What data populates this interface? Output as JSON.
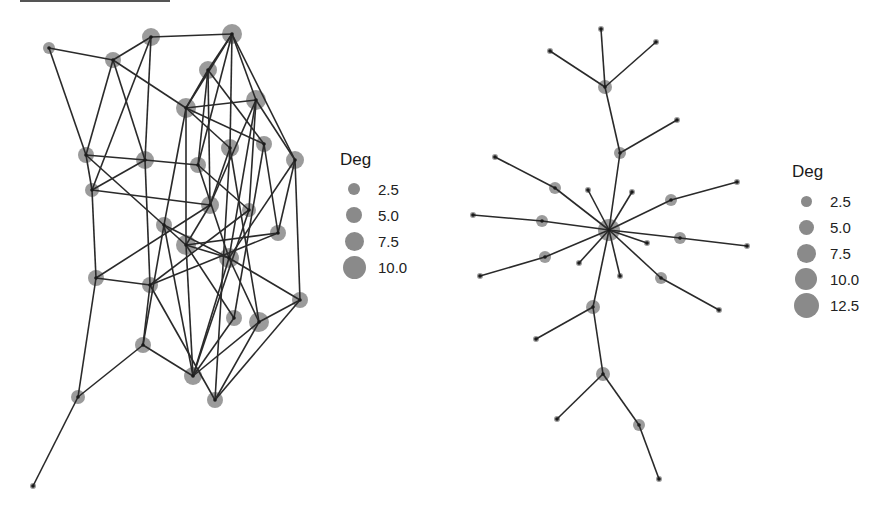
{
  "colors": {
    "edge": "#2a2a2a",
    "node": "#8a8a8a",
    "node_center": "#1a1a1a",
    "background": "#ffffff"
  },
  "graphs": [
    {
      "name": "left-network",
      "legend": {
        "title": "Deg",
        "left": 340,
        "top": 150,
        "items": [
          {
            "label": "2.5",
            "size": 12
          },
          {
            "label": "5.0",
            "size": 16
          },
          {
            "label": "7.5",
            "size": 19
          },
          {
            "label": "10.0",
            "size": 23
          }
        ]
      },
      "nodes": [
        {
          "x": 49,
          "y": 48,
          "r": 6
        },
        {
          "x": 113,
          "y": 60,
          "r": 8
        },
        {
          "x": 151,
          "y": 37,
          "r": 9
        },
        {
          "x": 232,
          "y": 34,
          "r": 10
        },
        {
          "x": 208,
          "y": 70,
          "r": 9
        },
        {
          "x": 186,
          "y": 108,
          "r": 10
        },
        {
          "x": 256,
          "y": 100,
          "r": 10
        },
        {
          "x": 86,
          "y": 155,
          "r": 8
        },
        {
          "x": 145,
          "y": 160,
          "r": 9
        },
        {
          "x": 198,
          "y": 165,
          "r": 8
        },
        {
          "x": 230,
          "y": 148,
          "r": 9
        },
        {
          "x": 264,
          "y": 144,
          "r": 8
        },
        {
          "x": 295,
          "y": 160,
          "r": 9
        },
        {
          "x": 92,
          "y": 190,
          "r": 7
        },
        {
          "x": 210,
          "y": 205,
          "r": 9
        },
        {
          "x": 249,
          "y": 210,
          "r": 7
        },
        {
          "x": 164,
          "y": 225,
          "r": 8
        },
        {
          "x": 278,
          "y": 233,
          "r": 8
        },
        {
          "x": 186,
          "y": 245,
          "r": 10
        },
        {
          "x": 229,
          "y": 258,
          "r": 10
        },
        {
          "x": 96,
          "y": 278,
          "r": 8
        },
        {
          "x": 150,
          "y": 285,
          "r": 8
        },
        {
          "x": 300,
          "y": 300,
          "r": 8
        },
        {
          "x": 234,
          "y": 318,
          "r": 8
        },
        {
          "x": 259,
          "y": 322,
          "r": 10
        },
        {
          "x": 143,
          "y": 345,
          "r": 8
        },
        {
          "x": 193,
          "y": 376,
          "r": 9
        },
        {
          "x": 215,
          "y": 400,
          "r": 8
        },
        {
          "x": 78,
          "y": 397,
          "r": 7
        },
        {
          "x": 33,
          "y": 486,
          "r": 3
        }
      ],
      "edges": [
        [
          0,
          1
        ],
        [
          0,
          7
        ],
        [
          1,
          2
        ],
        [
          1,
          7
        ],
        [
          1,
          8
        ],
        [
          1,
          5
        ],
        [
          2,
          3
        ],
        [
          2,
          8
        ],
        [
          2,
          13
        ],
        [
          3,
          4
        ],
        [
          3,
          5
        ],
        [
          3,
          6
        ],
        [
          3,
          10
        ],
        [
          3,
          12
        ],
        [
          3,
          9
        ],
        [
          4,
          5
        ],
        [
          4,
          9
        ],
        [
          4,
          14
        ],
        [
          4,
          11
        ],
        [
          5,
          6
        ],
        [
          5,
          11
        ],
        [
          5,
          10
        ],
        [
          5,
          18
        ],
        [
          5,
          16
        ],
        [
          6,
          12
        ],
        [
          6,
          14
        ],
        [
          6,
          19
        ],
        [
          6,
          15
        ],
        [
          7,
          8
        ],
        [
          7,
          13
        ],
        [
          7,
          18
        ],
        [
          8,
          9
        ],
        [
          8,
          21
        ],
        [
          8,
          13
        ],
        [
          9,
          19
        ],
        [
          9,
          15
        ],
        [
          10,
          14
        ],
        [
          10,
          24
        ],
        [
          11,
          17
        ],
        [
          11,
          23
        ],
        [
          12,
          17
        ],
        [
          12,
          19
        ],
        [
          12,
          22
        ],
        [
          13,
          20
        ],
        [
          13,
          14
        ],
        [
          14,
          18
        ],
        [
          14,
          20
        ],
        [
          15,
          21
        ],
        [
          16,
          19
        ],
        [
          16,
          26
        ],
        [
          17,
          18
        ],
        [
          17,
          21
        ],
        [
          18,
          19
        ],
        [
          18,
          23
        ],
        [
          18,
          26
        ],
        [
          19,
          22
        ],
        [
          19,
          24
        ],
        [
          19,
          26
        ],
        [
          20,
          21
        ],
        [
          20,
          28
        ],
        [
          21,
          25
        ],
        [
          21,
          27
        ],
        [
          22,
          24
        ],
        [
          22,
          27
        ],
        [
          23,
          26
        ],
        [
          24,
          26
        ],
        [
          24,
          27
        ],
        [
          25,
          26
        ],
        [
          25,
          28
        ],
        [
          28,
          29
        ],
        [
          16,
          25
        ],
        [
          10,
          27
        ],
        [
          15,
          26
        ]
      ]
    },
    {
      "name": "right-network",
      "legend": {
        "title": "Deg",
        "left": 792,
        "top": 162,
        "items": [
          {
            "label": "2.5",
            "size": 11
          },
          {
            "label": "5.0",
            "size": 15
          },
          {
            "label": "7.5",
            "size": 19
          },
          {
            "label": "10.0",
            "size": 22
          },
          {
            "label": "12.5",
            "size": 25
          }
        ]
      },
      "nodes": [
        {
          "x": 609,
          "y": 230,
          "r": 11
        },
        {
          "x": 605,
          "y": 87,
          "r": 7
        },
        {
          "x": 550,
          "y": 51,
          "r": 3
        },
        {
          "x": 601,
          "y": 29,
          "r": 3
        },
        {
          "x": 656,
          "y": 42,
          "r": 3
        },
        {
          "x": 620,
          "y": 153,
          "r": 6
        },
        {
          "x": 677,
          "y": 120,
          "r": 3
        },
        {
          "x": 555,
          "y": 188,
          "r": 6
        },
        {
          "x": 495,
          "y": 157,
          "r": 3
        },
        {
          "x": 542,
          "y": 221,
          "r": 6
        },
        {
          "x": 473,
          "y": 215,
          "r": 3
        },
        {
          "x": 545,
          "y": 257,
          "r": 6
        },
        {
          "x": 480,
          "y": 276,
          "r": 3
        },
        {
          "x": 671,
          "y": 200,
          "r": 6
        },
        {
          "x": 737,
          "y": 182,
          "r": 3
        },
        {
          "x": 680,
          "y": 238,
          "r": 6
        },
        {
          "x": 747,
          "y": 246,
          "r": 3
        },
        {
          "x": 661,
          "y": 278,
          "r": 6
        },
        {
          "x": 719,
          "y": 310,
          "r": 3
        },
        {
          "x": 588,
          "y": 190,
          "r": 3
        },
        {
          "x": 632,
          "y": 192,
          "r": 3
        },
        {
          "x": 579,
          "y": 263,
          "r": 3
        },
        {
          "x": 620,
          "y": 276,
          "r": 3
        },
        {
          "x": 647,
          "y": 243,
          "r": 3
        },
        {
          "x": 593,
          "y": 307,
          "r": 7
        },
        {
          "x": 536,
          "y": 339,
          "r": 3
        },
        {
          "x": 603,
          "y": 374,
          "r": 7
        },
        {
          "x": 557,
          "y": 419,
          "r": 3
        },
        {
          "x": 639,
          "y": 425,
          "r": 6
        },
        {
          "x": 659,
          "y": 479,
          "r": 3
        }
      ],
      "edges": [
        [
          0,
          5
        ],
        [
          5,
          1
        ],
        [
          1,
          2
        ],
        [
          1,
          3
        ],
        [
          1,
          4
        ],
        [
          5,
          6
        ],
        [
          0,
          7
        ],
        [
          7,
          8
        ],
        [
          0,
          9
        ],
        [
          9,
          10
        ],
        [
          0,
          11
        ],
        [
          11,
          12
        ],
        [
          0,
          13
        ],
        [
          13,
          14
        ],
        [
          0,
          15
        ],
        [
          15,
          16
        ],
        [
          0,
          17
        ],
        [
          17,
          18
        ],
        [
          0,
          19
        ],
        [
          0,
          20
        ],
        [
          0,
          21
        ],
        [
          0,
          22
        ],
        [
          0,
          23
        ],
        [
          0,
          24
        ],
        [
          24,
          25
        ],
        [
          24,
          26
        ],
        [
          26,
          27
        ],
        [
          26,
          28
        ],
        [
          28,
          29
        ]
      ]
    }
  ]
}
